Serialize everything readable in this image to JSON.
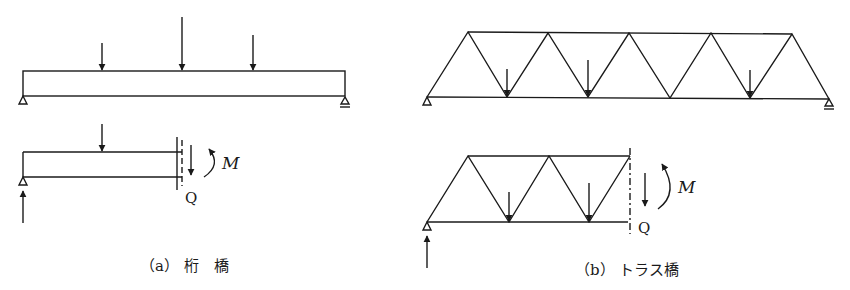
{
  "figure": {
    "panel_a": {
      "caption": "（a） 桁　橋",
      "moment_label": "M",
      "shear_label": "Q"
    },
    "panel_b": {
      "caption": "（b） トラス橋",
      "moment_label": "M",
      "shear_label": "Q"
    },
    "colors": {
      "line": "#1a1a1a",
      "background": "#ffffff"
    }
  }
}
